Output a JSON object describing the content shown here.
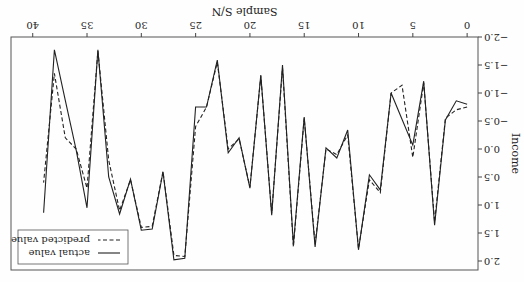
{
  "chart_data": {
    "type": "line",
    "title": "",
    "xlabel": "Sample S/N",
    "ylabel": "Income",
    "xlim": [
      0,
      40
    ],
    "ylim": [
      -2.0,
      2.0
    ],
    "xticks": [
      0,
      5,
      10,
      15,
      20,
      25,
      30,
      35,
      40
    ],
    "xtick_labels": [
      "0",
      "5",
      "10",
      "15",
      "20",
      "25",
      "30",
      "35",
      "40"
    ],
    "yticks": [
      -2.0,
      -1.5,
      -1.0,
      -0.5,
      0.0,
      0.5,
      1.0,
      1.5,
      2.0
    ],
    "ytick_labels": [
      "−2.0",
      "−1.5",
      "−1.0",
      "−0.5",
      "0.0",
      "0.5",
      "1.0",
      "1.5",
      "2.0"
    ],
    "grid": false,
    "legend_position": "top-right",
    "rotation_deg": 180,
    "x": [
      0,
      1,
      2,
      3,
      4,
      5,
      6,
      7,
      8,
      9,
      10,
      11,
      12,
      13,
      14,
      15,
      16,
      17,
      18,
      19,
      20,
      21,
      22,
      23,
      24,
      25,
      26,
      27,
      28,
      29,
      30,
      31,
      32,
      33,
      34,
      35,
      36,
      37,
      38,
      39
    ],
    "series": [
      {
        "name": "actual value",
        "style": "solid",
        "color": "#222222",
        "values": [
          -0.8,
          -0.86,
          -0.52,
          1.36,
          -1.21,
          -0.07,
          -0.53,
          -1.0,
          0.73,
          0.46,
          1.8,
          -0.34,
          0.16,
          -0.02,
          1.75,
          -0.57,
          1.71,
          -1.5,
          1.18,
          -1.32,
          0.7,
          -0.2,
          0.07,
          -1.59,
          -0.75,
          -0.75,
          1.95,
          1.98,
          0.41,
          1.43,
          1.45,
          0.54,
          1.16,
          0.5,
          -1.77,
          1.05,
          0.02,
          -0.87,
          -1.77,
          1.14
        ]
      },
      {
        "name": "predicted value",
        "style": "dashed",
        "color": "#222222",
        "values": [
          -0.75,
          -0.7,
          -0.55,
          1.3,
          -1.18,
          0.15,
          -1.14,
          -1.0,
          0.78,
          0.55,
          1.78,
          -0.25,
          0.1,
          0.0,
          1.7,
          -0.55,
          1.75,
          -1.45,
          1.15,
          -1.3,
          0.68,
          -0.18,
          0.0,
          -1.55,
          -0.75,
          -0.4,
          1.92,
          1.9,
          0.4,
          1.38,
          1.4,
          0.55,
          1.1,
          0.2,
          -1.75,
          0.7,
          0.0,
          -0.2,
          -1.35,
          0.6
        ]
      }
    ]
  }
}
